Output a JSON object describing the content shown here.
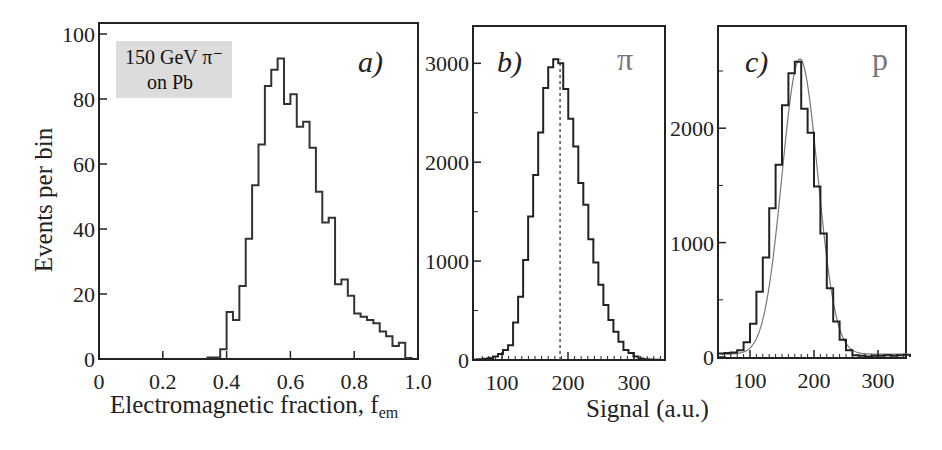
{
  "chart_data": [
    {
      "type": "bar",
      "panel": "a)",
      "subtype": "step-histogram",
      "title": "",
      "annotation": [
        "150 GeV π⁻",
        "on Pb"
      ],
      "xlabel": "Electromagnetic fraction, f",
      "xlabel_sub": "em",
      "ylabel": "Events per bin",
      "xlim": [
        0,
        1.0
      ],
      "ylim": [
        0,
        100
      ],
      "xticks": [
        "0",
        "0.2",
        "0.4",
        "0.6",
        "0.8",
        "1.0"
      ],
      "yticks": [
        "0",
        "20",
        "40",
        "60",
        "80",
        "100"
      ],
      "bin_width": 0.02,
      "bin_edges_start": 0.34,
      "values": [
        0.5,
        0.5,
        3,
        14.5,
        12,
        22.5,
        37,
        53.5,
        66,
        84,
        89,
        92.5,
        78.5,
        81.5,
        71.5,
        73,
        65,
        51.5,
        42,
        43.5,
        23,
        24.5,
        19.5,
        14,
        13,
        12,
        11,
        8.5,
        7,
        4,
        5,
        0.3
      ]
    },
    {
      "type": "bar",
      "panel": "b)",
      "subtype": "step-histogram",
      "particle": "π",
      "xlabel": "Signal (a.u.)",
      "ylabel": "",
      "xlim": [
        56,
        350
      ],
      "ylim": [
        0,
        3350
      ],
      "xticks": [
        "100",
        "200",
        "300"
      ],
      "yticks": [
        "0",
        "1000",
        "2000",
        "3000"
      ],
      "mean_line": 188,
      "bin_width": 7.6,
      "bin_edges_start": 56,
      "values": [
        5,
        8,
        12,
        20,
        35,
        60,
        100,
        150,
        380,
        640,
        1010,
        1450,
        1870,
        2300,
        2750,
        2960,
        3040,
        3000,
        2740,
        2440,
        2160,
        1790,
        1570,
        1220,
        985,
        760,
        555,
        405,
        285,
        185,
        100,
        70,
        35,
        15,
        8,
        4,
        2,
        1
      ]
    },
    {
      "type": "bar",
      "panel": "c)",
      "subtype": "step-histogram-with-fit",
      "particle": "p",
      "xlabel": "Signal (a.u.)",
      "ylabel": "",
      "xlim": [
        50,
        350
      ],
      "ylim": [
        0,
        2620
      ],
      "xticks": [
        "100",
        "200",
        "300"
      ],
      "yticks": [
        "0",
        "1000",
        "2000"
      ],
      "bin_width": 10,
      "bin_edges_start": 50,
      "values": [
        30,
        35,
        40,
        60,
        130,
        290,
        570,
        870,
        1300,
        1680,
        2200,
        2480,
        2580,
        2170,
        1960,
        1490,
        1080,
        600,
        310,
        150,
        60,
        15,
        10,
        5,
        10,
        10,
        15,
        10,
        15,
        20
      ],
      "fit": {
        "mean": 178,
        "sigma": 28,
        "amplitude": 2580
      }
    }
  ],
  "shared_xlabel": "Signal (a.u.)"
}
